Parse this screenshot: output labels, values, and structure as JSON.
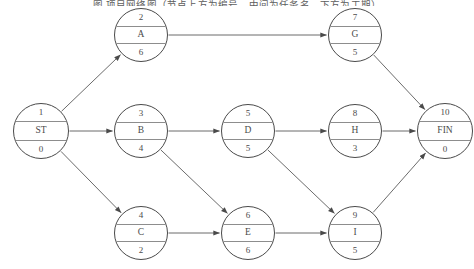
{
  "caption": {
    "text": "图  项目网络图（节点上方为编号，中间为任务名，下方为工期）"
  },
  "colors": {
    "node_stroke": "#4a4a4a",
    "divider": "#8d8d8d",
    "edge": "#5a5a5a",
    "text": "#4b4b4b",
    "background": "#ffffff"
  },
  "diagram": {
    "type": "activity-on-node network",
    "node_fields": [
      "id",
      "name",
      "duration"
    ],
    "nodes": [
      {
        "key": "ST",
        "id": "1",
        "name": "ST",
        "duration": "0",
        "cx": 41,
        "cy": 131,
        "r": 28
      },
      {
        "key": "A",
        "id": "2",
        "name": "A",
        "duration": "6",
        "cx": 141,
        "cy": 35,
        "r": 27
      },
      {
        "key": "B",
        "id": "3",
        "name": "B",
        "duration": "4",
        "cx": 141,
        "cy": 131,
        "r": 27
      },
      {
        "key": "C",
        "id": "4",
        "name": "C",
        "duration": "2",
        "cx": 141,
        "cy": 233,
        "r": 27
      },
      {
        "key": "D",
        "id": "5",
        "name": "D",
        "duration": "5",
        "cx": 248,
        "cy": 131,
        "r": 27
      },
      {
        "key": "E",
        "id": "6",
        "name": "E",
        "duration": "6",
        "cx": 248,
        "cy": 233,
        "r": 27
      },
      {
        "key": "G",
        "id": "7",
        "name": "G",
        "duration": "5",
        "cx": 355,
        "cy": 35,
        "r": 27
      },
      {
        "key": "H",
        "id": "8",
        "name": "H",
        "duration": "3",
        "cx": 355,
        "cy": 131,
        "r": 27
      },
      {
        "key": "I",
        "id": "9",
        "name": "I",
        "duration": "5",
        "cx": 355,
        "cy": 233,
        "r": 27
      },
      {
        "key": "FIN",
        "id": "10",
        "name": "FIN",
        "duration": "0",
        "cx": 445,
        "cy": 131,
        "r": 28
      }
    ],
    "edges": [
      {
        "from": "ST",
        "to": "A"
      },
      {
        "from": "ST",
        "to": "B"
      },
      {
        "from": "ST",
        "to": "C"
      },
      {
        "from": "A",
        "to": "G"
      },
      {
        "from": "B",
        "to": "D"
      },
      {
        "from": "B",
        "to": "E"
      },
      {
        "from": "C",
        "to": "E"
      },
      {
        "from": "D",
        "to": "H"
      },
      {
        "from": "D",
        "to": "I"
      },
      {
        "from": "E",
        "to": "I"
      },
      {
        "from": "G",
        "to": "FIN"
      },
      {
        "from": "H",
        "to": "FIN"
      },
      {
        "from": "I",
        "to": "FIN"
      }
    ]
  }
}
